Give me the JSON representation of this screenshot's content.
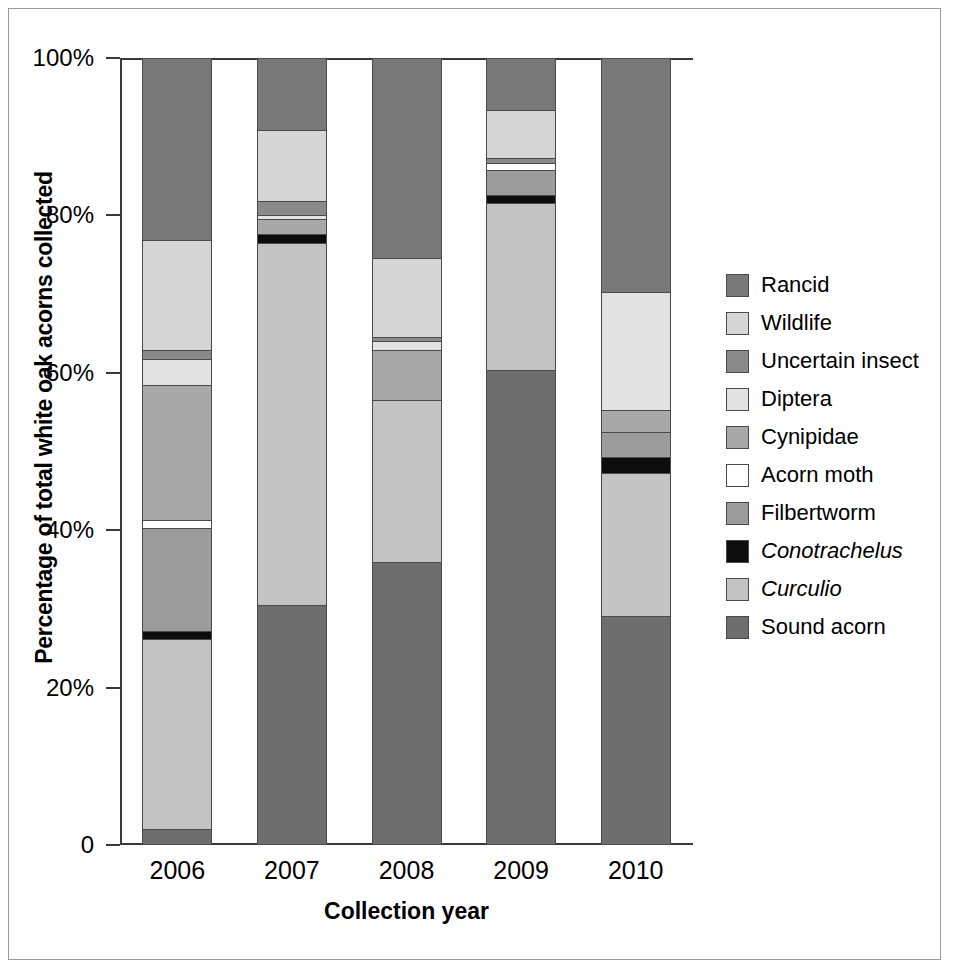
{
  "chart_data": {
    "type": "bar",
    "subtype": "stacked-percentage",
    "title": "",
    "xlabel": "Collection year",
    "ylabel": "Percentage of total white oak acorns collected",
    "categories": [
      "2006",
      "2007",
      "2008",
      "2009",
      "2010"
    ],
    "ytick_labels": [
      "0",
      "20%",
      "40%",
      "60%",
      "80%",
      "100%"
    ],
    "ytick_values": [
      0,
      20,
      40,
      60,
      80,
      100
    ],
    "ylim": [
      0,
      100
    ],
    "grid": false,
    "legend_position": "right",
    "legend_order_top_to_bottom": [
      "Rancid",
      "Wildlife",
      "Uncertain insect",
      "Diptera",
      "Cynipidae",
      "Acorn moth",
      "Filbertworm",
      "Conotrachelus",
      "Curculio",
      "Sound acorn"
    ],
    "series": [
      {
        "name": "Sound acorn",
        "color": "#6e6e6e",
        "italic": false,
        "values": [
          2.0,
          30.5,
          35.9,
          60.3,
          29.1
        ]
      },
      {
        "name": "Curculio",
        "color": "#c3c3c3",
        "italic": true,
        "values": [
          24.2,
          46.0,
          20.7,
          21.3,
          18.2
        ]
      },
      {
        "name": "Conotrachelus",
        "color": "#0d0d0d",
        "italic": true,
        "values": [
          1.0,
          1.1,
          0.0,
          1.0,
          2.0
        ]
      },
      {
        "name": "Filbertworm",
        "color": "#9c9c9c",
        "italic": false,
        "values": [
          13.1,
          0.0,
          0.0,
          3.2,
          3.2
        ]
      },
      {
        "name": "Acorn moth",
        "color": "#ffffff",
        "italic": false,
        "values": [
          1.0,
          0.0,
          0.0,
          0.9,
          0.0
        ]
      },
      {
        "name": "Cynipidae",
        "color": "#a8a8a8",
        "italic": false,
        "values": [
          17.1,
          1.9,
          6.3,
          0.0,
          2.8
        ]
      },
      {
        "name": "Diptera",
        "color": "#e2e2e2",
        "italic": false,
        "values": [
          3.3,
          0.6,
          1.1,
          0.0,
          15.0
        ]
      },
      {
        "name": "Uncertain insect",
        "color": "#8a8a8a",
        "italic": false,
        "values": [
          1.2,
          1.7,
          0.5,
          0.6,
          0.0
        ]
      },
      {
        "name": "Wildlife",
        "color": "#d6d6d6",
        "italic": false,
        "values": [
          14.0,
          9.0,
          10.1,
          6.1,
          0.0
        ]
      },
      {
        "name": "Rancid",
        "color": "#787878",
        "italic": false,
        "values": [
          23.1,
          9.2,
          25.4,
          6.6,
          29.7
        ]
      }
    ]
  },
  "axis": {
    "y_title": "Percentage of total white oak acorns collected",
    "x_title": "Collection year",
    "y_ticks": [
      "100%",
      "80%",
      "60%",
      "40%",
      "20%",
      "0"
    ],
    "x_ticks": [
      "2006",
      "2007",
      "2008",
      "2009",
      "2010"
    ]
  },
  "legend": {
    "items": [
      {
        "label": "Rancid",
        "color": "#787878",
        "italic": false
      },
      {
        "label": "Wildlife",
        "color": "#d6d6d6",
        "italic": false
      },
      {
        "label": "Uncertain insect",
        "color": "#8a8a8a",
        "italic": false
      },
      {
        "label": "Diptera",
        "color": "#e2e2e2",
        "italic": false
      },
      {
        "label": "Cynipidae",
        "color": "#a8a8a8",
        "italic": false
      },
      {
        "label": "Acorn moth",
        "color": "#ffffff",
        "italic": false
      },
      {
        "label": "Filbertworm",
        "color": "#9c9c9c",
        "italic": false
      },
      {
        "label": "Conotrachelus",
        "color": "#0d0d0d",
        "italic": true
      },
      {
        "label": "Curculio",
        "color": "#c3c3c3",
        "italic": true
      },
      {
        "label": "Sound acorn",
        "color": "#6e6e6e",
        "italic": false
      }
    ]
  }
}
